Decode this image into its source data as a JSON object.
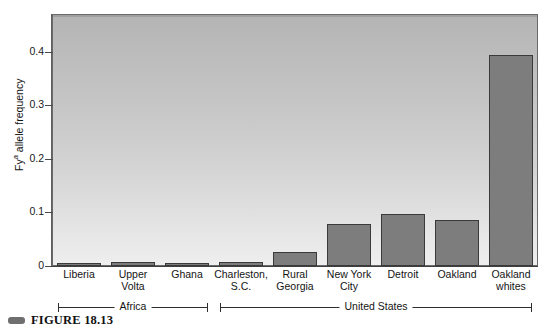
{
  "figure": {
    "caption_marker": "caption-marker",
    "caption": "FIGURE 18.13"
  },
  "chart_data": {
    "type": "bar",
    "title": "",
    "xlabel": "",
    "ylabel": "Fy a allele frequency",
    "ylabel_base": "Fy",
    "ylabel_sup": "a",
    "ylabel_rest": " allele frequency",
    "ylim": [
      0,
      0.47
    ],
    "yticks": [
      0,
      0.1,
      0.2,
      0.3,
      0.4
    ],
    "ytick_labels": [
      "0",
      "0.1",
      "0.2",
      "0.3",
      "0.4"
    ],
    "grid": false,
    "legend": "none",
    "bar_color": "#7d7d7d",
    "bar_edge_color": "#3a3a3a",
    "plot_bg_top": "#b4b4b4",
    "plot_bg_bottom": "#eeeeee",
    "categories": [
      "Liberia",
      "Upper\nVolta",
      "Ghana",
      "Charleston,\nS.C.",
      "Rural\nGeorgia",
      "New York\nCity",
      "Detroit",
      "Oakland",
      "Oakland\nwhites"
    ],
    "values": [
      0.006,
      0.008,
      0.006,
      0.008,
      0.026,
      0.078,
      0.097,
      0.085,
      0.394
    ],
    "groups": [
      {
        "label": "Africa",
        "start_index": 0,
        "end_index": 2
      },
      {
        "label": "United States",
        "start_index": 3,
        "end_index": 8
      }
    ]
  }
}
